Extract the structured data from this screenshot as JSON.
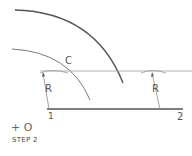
{
  "diagram": {
    "step_label": "STEP 2",
    "center_marker": "+ O",
    "labels": {
      "arc_c": "C",
      "radius_left": "R",
      "radius_right": "R",
      "point_1": "1",
      "point_2": "2"
    },
    "colors": {
      "line": "#8a8a8a",
      "thick_line": "#555555",
      "text": "#555555"
    }
  }
}
